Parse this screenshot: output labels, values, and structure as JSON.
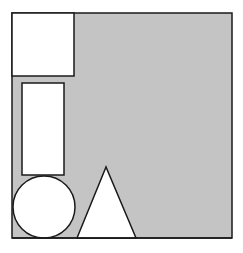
{
  "canvas": {
    "width": 243,
    "height": 253,
    "background": "#ffffff"
  },
  "colors": {
    "fill_gray": "#c4c4c4",
    "shape_fill": "#ffffff",
    "stroke": "#1a1a1a"
  },
  "diagram": {
    "container": {
      "shape": "square",
      "x": 12,
      "y": 13,
      "width": 220,
      "height": 225,
      "fill": "gray"
    },
    "shapes": [
      {
        "type": "square",
        "x": 12,
        "y": 13,
        "width": 62,
        "height": 63
      },
      {
        "type": "rectangle",
        "x": 22,
        "y": 83,
        "width": 42,
        "height": 92
      },
      {
        "type": "circle",
        "cx": 44,
        "cy": 207,
        "r": 31
      },
      {
        "type": "triangle",
        "points": [
          [
            106,
            167
          ],
          [
            77,
            238
          ],
          [
            136,
            238
          ]
        ]
      }
    ]
  }
}
